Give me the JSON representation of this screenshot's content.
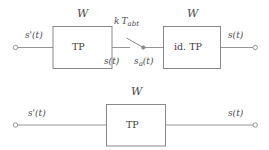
{
  "diagram": {
    "line_color": "#8a8a8a",
    "box_stroke": "#7d7d7d",
    "text_color": "#4a4a4a",
    "background": "#ffffff"
  },
  "top_chain": {
    "input_label": "s'(t)",
    "block1": {
      "name": "TP",
      "label": "TP",
      "bandwidth_label": "W",
      "output_label": "s(t)"
    },
    "switch": {
      "label_k": "k",
      "label_t": "T",
      "label_sub": "abt",
      "sampled_label": "s",
      "sampled_sub": "a",
      "sampled_tail": "(t)"
    },
    "block2": {
      "name": "id. TP",
      "label": "id. TP",
      "bandwidth_label": "W"
    },
    "output_label": "s(t)"
  },
  "bottom_chain": {
    "input_label": "s'(t)",
    "block": {
      "name": "TP",
      "label": "TP",
      "bandwidth_label": "W"
    },
    "output_label": "s(t)"
  }
}
